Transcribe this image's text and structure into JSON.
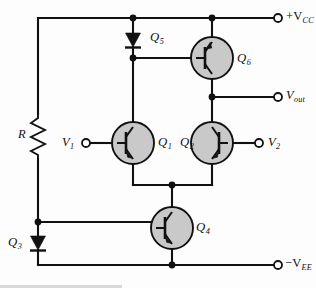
{
  "figure": {
    "type": "schematic",
    "background": "#fdfdfd",
    "wire_color": "#111111",
    "device_fill": "#c9c9c9"
  },
  "labels": {
    "supply_positive": "+V",
    "supply_positive_sub": "CC",
    "supply_negative": "−V",
    "supply_negative_sub": "EE",
    "output": "V",
    "output_sub": "out",
    "input_1": "V",
    "input_1_sub": "1",
    "input_2": "V",
    "input_2_sub": "2",
    "resistor": "R",
    "q1": "Q",
    "q1_sub": "1",
    "q2": "Q",
    "q2_sub": "2",
    "q3": "Q",
    "q3_sub": "3",
    "q4": "Q",
    "q4_sub": "4",
    "q5": "Q",
    "q5_sub": "5",
    "q6": "Q",
    "q6_sub": "6"
  },
  "components": [
    {
      "id": "R",
      "kind": "resistor",
      "label": "R",
      "node": "V_CC rail to Q3 anode"
    },
    {
      "id": "Q3",
      "kind": "diode",
      "label": "Q3",
      "node": "bias diode to -V_EE"
    },
    {
      "id": "Q5",
      "kind": "diode",
      "label": "Q5",
      "node": "mirror diode from +V_CC"
    },
    {
      "id": "Q6",
      "kind": "transistor",
      "label": "Q6",
      "node": "active load, emitter to +V_CC"
    },
    {
      "id": "Q1",
      "kind": "transistor",
      "label": "Q1",
      "node": "differential pair, base V1"
    },
    {
      "id": "Q2",
      "kind": "transistor",
      "label": "Q2",
      "node": "differential pair, base V2"
    },
    {
      "id": "Q4",
      "kind": "transistor",
      "label": "Q4",
      "node": "tail current source"
    }
  ],
  "terminals": [
    {
      "id": "vcc",
      "label": "+V CC",
      "position": "top-right"
    },
    {
      "id": "vout",
      "label": "V out",
      "position": "mid-right"
    },
    {
      "id": "v2",
      "label": "V 2",
      "position": "mid-right"
    },
    {
      "id": "v1",
      "label": "V 1",
      "position": "mid-left"
    },
    {
      "id": "vee",
      "label": "-V EE",
      "position": "bottom-right"
    }
  ]
}
